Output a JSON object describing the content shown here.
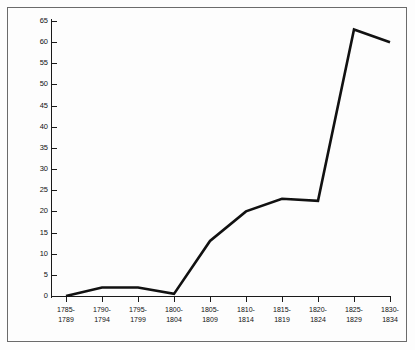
{
  "chart_data": {
    "type": "line",
    "title": "",
    "subtitle": "",
    "xlabel": "",
    "ylabel": "",
    "categories": [
      "1785-1789",
      "1790-1794",
      "1795-1799",
      "1800-1804",
      "1805-1809",
      "1810-1814",
      "1815-1819",
      "1820-1824",
      "1825-1829",
      "1830-1834"
    ],
    "category_lines": [
      [
        "1785-",
        "1789"
      ],
      [
        "1790-",
        "1794"
      ],
      [
        "1795-",
        "1799"
      ],
      [
        "1800-",
        "1804"
      ],
      [
        "1805-",
        "1809"
      ],
      [
        "1810-",
        "1814"
      ],
      [
        "1815-",
        "1819"
      ],
      [
        "1820-",
        "1824"
      ],
      [
        "1825-",
        "1829"
      ],
      [
        "1830-",
        "1834"
      ]
    ],
    "values": [
      0,
      2,
      2,
      0.5,
      13,
      20,
      23,
      22.5,
      63,
      60
    ],
    "ylim": [
      0,
      65
    ],
    "ytick_labels": [
      "65",
      "60",
      "55",
      "50",
      "45",
      "40",
      "35",
      "30",
      "25",
      "20",
      "15",
      "10",
      "5",
      "0"
    ],
    "ytick_values": [
      65,
      60,
      55,
      50,
      45,
      40,
      35,
      30,
      25,
      20,
      15,
      10,
      5,
      0
    ],
    "grid": false,
    "legend": "none",
    "series_color": "#111111",
    "axis_color": "#1a1a1a",
    "frame_color": "#6b6b6b",
    "background_color": "#fdfdfd"
  }
}
